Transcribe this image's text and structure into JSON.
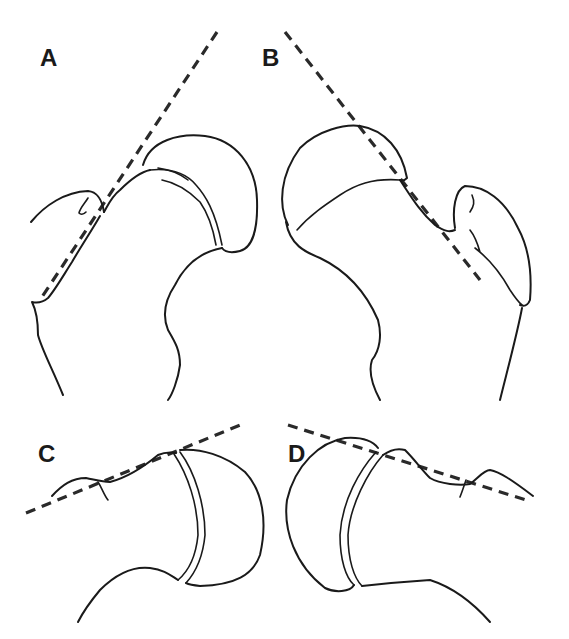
{
  "figure": {
    "panels": [
      {
        "id": "A",
        "label": "A",
        "description": "proximal femur, head-neck junction with dashed tangent line (left orientation)"
      },
      {
        "id": "B",
        "label": "B",
        "description": "proximal femur, head-neck junction with dashed tangent line (right orientation)"
      },
      {
        "id": "C",
        "label": "C",
        "description": "joint head in socket with dashed tangent line (left orientation)"
      },
      {
        "id": "D",
        "label": "D",
        "description": "joint head in socket with dashed tangent line (right orientation)"
      }
    ],
    "colors": {
      "line": "#1a1a1a",
      "dashed_line": "#2a2a2a",
      "background": "#ffffff"
    }
  }
}
